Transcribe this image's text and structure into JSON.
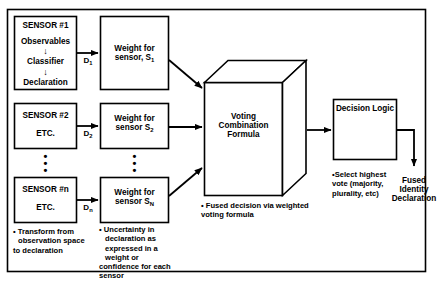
{
  "diagram": {
    "frame": {
      "name": "outer-border"
    },
    "sensors": [
      {
        "id": "sensor-1",
        "title": "SENSOR #1",
        "lines": [
          "Observables",
          "Classifier",
          "Declaration"
        ],
        "arrow_glyph": "↓",
        "output_label_main": "D",
        "output_label_sub": "1"
      },
      {
        "id": "sensor-2",
        "title": "SENSOR #2",
        "lines": [
          "ETC."
        ],
        "output_label_main": "D",
        "output_label_sub": "2"
      },
      {
        "id": "sensor-n",
        "title": "SENSOR #n",
        "lines": [
          "ETC."
        ],
        "output_label_main": "D",
        "output_label_sub": "n"
      }
    ],
    "weights": [
      {
        "id": "weight-1",
        "line1": "Weight for",
        "line2_main": "sensor, S",
        "line2_sub": "1"
      },
      {
        "id": "weight-2",
        "line1": "Weight for",
        "line2_main": "sensor S",
        "line2_sub": "2"
      },
      {
        "id": "weight-n",
        "line1": "Weight for",
        "line2_main": "sensor S",
        "line2_sub": "N"
      }
    ],
    "fusion_block": {
      "id": "voting-combination-formula",
      "line1": "Voting",
      "line2": "Combination",
      "line3": "Formula"
    },
    "decision_logic": {
      "id": "decision-logic",
      "label": "Decision Logic"
    },
    "output": {
      "id": "fused-identity-declaration",
      "line1": "Fused",
      "line2": "Identity",
      "line3": "Declaration"
    },
    "ellipsis": "•\n•\n•",
    "notes": [
      {
        "id": "note-transform",
        "bullet": "•",
        "lines": [
          "Transform from",
          "observation space",
          "to  declaration"
        ]
      },
      {
        "id": "note-uncertainty",
        "bullet": "•",
        "lines": [
          "Uncertainty in",
          "declaration as",
          "expressed in a",
          "weight or",
          "confidence for each",
          "sensor"
        ]
      },
      {
        "id": "note-fused-decision",
        "bullet": "•",
        "lines": [
          "Fused decision via weighted",
          "voting formula"
        ]
      },
      {
        "id": "note-select-highest",
        "bullet": "•",
        "lines": [
          "Select highest",
          "vote (majority,",
          "plurality, etc)"
        ]
      }
    ],
    "colors": {
      "line": "#000000",
      "background": "#ffffff"
    }
  }
}
